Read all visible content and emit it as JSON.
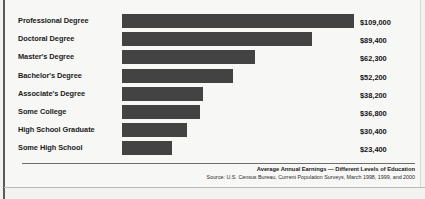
{
  "chart_data": {
    "type": "bar",
    "orientation": "horizontal",
    "title": "Average Annual Earnings — Different Levels of Education",
    "source": "Source: U.S. Census Bureau, Current Population Surveys, March 1998, 1999, and 2000",
    "xlabel": "",
    "ylabel": "",
    "grid": false,
    "legend": "none",
    "xlim": [
      0,
      109000
    ],
    "bar_color": "#434343",
    "background_color": "#f7f7f5",
    "categories": [
      "Professional Degree",
      "Doctoral Degree",
      "Master's Degree",
      "Bachelor's Degree",
      "Associate's Degree",
      "Some College",
      "High School Graduate",
      "Some High School"
    ],
    "values": [
      109000,
      89400,
      62300,
      52200,
      38200,
      36800,
      30400,
      23400
    ],
    "value_labels": [
      "$109,000",
      "$89,400",
      "$62,300",
      "$52,200",
      "$38,200",
      "$36,800",
      "$30,400",
      "$23,400"
    ],
    "rows": [
      {
        "label": "Professional Degree",
        "value": 109000,
        "value_label": "$109,000"
      },
      {
        "label": "Doctoral Degree",
        "value": 89400,
        "value_label": "$89,400"
      },
      {
        "label": "Master's Degree",
        "value": 62300,
        "value_label": "$62,300"
      },
      {
        "label": "Bachelor's Degree",
        "value": 52200,
        "value_label": "$52,200"
      },
      {
        "label": "Associate's Degree",
        "value": 38200,
        "value_label": "$38,200"
      },
      {
        "label": "Some College",
        "value": 36800,
        "value_label": "$36,800"
      },
      {
        "label": "High School Graduate",
        "value": 30400,
        "value_label": "$30,400"
      },
      {
        "label": "Some High School",
        "value": 23400,
        "value_label": "$23,400"
      }
    ]
  }
}
